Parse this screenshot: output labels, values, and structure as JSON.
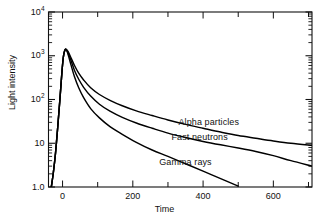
{
  "chart_data": {
    "type": "line",
    "title": "",
    "xlabel": "Time",
    "ylabel": "Light intensity",
    "yscale": "log",
    "xscale": "linear",
    "xlim": [
      -40,
      710
    ],
    "ylim": [
      1.0,
      10000
    ],
    "grid": false,
    "legend_position": "inline-annotations",
    "axis_frame": "box-all-four-sides",
    "y_ticks": [
      {
        "value": 10000,
        "label": "10",
        "exponent": "4"
      },
      {
        "value": 1000,
        "label": "10",
        "exponent": "3"
      },
      {
        "value": 100,
        "label": "10",
        "exponent": "2"
      },
      {
        "value": 10,
        "label": "10",
        "exponent": ""
      },
      {
        "value": 1,
        "label": "1.0",
        "exponent": ""
      }
    ],
    "y_minor_ticks": [
      2,
      3,
      4,
      5,
      6,
      7,
      8,
      9,
      20,
      30,
      40,
      50,
      60,
      70,
      80,
      90,
      200,
      300,
      400,
      500,
      600,
      700,
      800,
      900,
      2000,
      3000,
      4000,
      5000,
      6000,
      7000,
      8000,
      9000
    ],
    "x_ticks_major": [
      0,
      200,
      400,
      600
    ],
    "x_ticks_minor": [
      100,
      300,
      500,
      700
    ],
    "x_tick_labels": [
      "0",
      "200",
      "400",
      "600"
    ],
    "series": [
      {
        "name": "Alpha particles",
        "label": "Alpha particles",
        "color": "#000000",
        "annotation": "Alpha particles",
        "points": [
          [
            -32,
            1.0
          ],
          [
            -26,
            2.2
          ],
          [
            -20,
            6.0
          ],
          [
            -14,
            22
          ],
          [
            -8,
            90
          ],
          [
            -2,
            400
          ],
          [
            2,
            900
          ],
          [
            6,
            1300
          ],
          [
            10,
            1400
          ],
          [
            16,
            1250
          ],
          [
            24,
            900
          ],
          [
            34,
            600
          ],
          [
            46,
            400
          ],
          [
            60,
            280
          ],
          [
            80,
            185
          ],
          [
            105,
            130
          ],
          [
            135,
            96
          ],
          [
            170,
            72
          ],
          [
            210,
            55
          ],
          [
            255,
            43
          ],
          [
            300,
            34
          ],
          [
            350,
            27
          ],
          [
            400,
            22
          ],
          [
            450,
            18
          ],
          [
            500,
            15
          ],
          [
            550,
            13
          ],
          [
            600,
            11.3
          ],
          [
            650,
            10.0
          ],
          [
            710,
            9.0
          ]
        ]
      },
      {
        "name": "Fast neutrons",
        "label": "Fast neutrons",
        "color": "#000000",
        "annotation": "Fast neutrons",
        "points": [
          [
            -32,
            1.0
          ],
          [
            -26,
            2.2
          ],
          [
            -20,
            6.0
          ],
          [
            -14,
            22
          ],
          [
            -8,
            90
          ],
          [
            -2,
            400
          ],
          [
            2,
            900
          ],
          [
            6,
            1300
          ],
          [
            10,
            1400
          ],
          [
            16,
            1150
          ],
          [
            24,
            780
          ],
          [
            34,
            460
          ],
          [
            46,
            290
          ],
          [
            60,
            190
          ],
          [
            80,
            120
          ],
          [
            105,
            78
          ],
          [
            135,
            54
          ],
          [
            170,
            39
          ],
          [
            210,
            29
          ],
          [
            255,
            22
          ],
          [
            300,
            17
          ],
          [
            350,
            13.5
          ],
          [
            400,
            11.0
          ],
          [
            450,
            9.2
          ],
          [
            500,
            7.8
          ],
          [
            550,
            6.5
          ],
          [
            600,
            5.2
          ],
          [
            650,
            4.0
          ],
          [
            710,
            3.0
          ]
        ]
      },
      {
        "name": "Gamma rays",
        "label": "Gamma rays",
        "color": "#000000",
        "annotation": "Gamma rays",
        "points": [
          [
            -32,
            1.0
          ],
          [
            -26,
            2.2
          ],
          [
            -20,
            6.0
          ],
          [
            -14,
            22
          ],
          [
            -8,
            90
          ],
          [
            -2,
            400
          ],
          [
            2,
            900
          ],
          [
            6,
            1300
          ],
          [
            10,
            1400
          ],
          [
            16,
            1050
          ],
          [
            24,
            620
          ],
          [
            34,
            330
          ],
          [
            46,
            185
          ],
          [
            60,
            110
          ],
          [
            80,
            62
          ],
          [
            105,
            38
          ],
          [
            135,
            24
          ],
          [
            170,
            16
          ],
          [
            210,
            10.5
          ],
          [
            255,
            7.0
          ],
          [
            300,
            5.0
          ],
          [
            350,
            3.4
          ],
          [
            400,
            2.3
          ],
          [
            450,
            1.55
          ],
          [
            500,
            1.05
          ]
        ]
      }
    ],
    "annotations": [
      {
        "text": "Alpha particles",
        "x": 330,
        "y": 30
      },
      {
        "text": "Fast neutrons",
        "x": 310,
        "y": 13.5
      },
      {
        "text": "Gamma rays",
        "x": 275,
        "y": 3.6
      }
    ]
  },
  "axes": {
    "ylabel": "Light intensity",
    "xlabel": "Time"
  }
}
